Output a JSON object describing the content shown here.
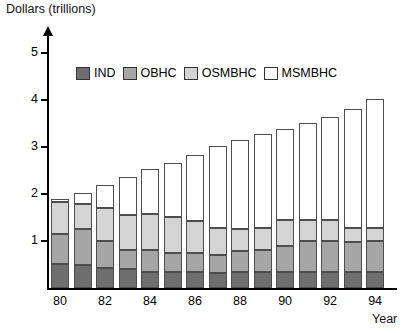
{
  "chart_data": {
    "type": "bar",
    "stacked": true,
    "title": "",
    "xlabel": "Year",
    "ylabel": "Dollars (trillions)",
    "ylim": [
      0,
      5.4
    ],
    "yticks": [
      1,
      2,
      3,
      4,
      5
    ],
    "ytick_labels": [
      "1",
      "2",
      "3",
      "4",
      "5"
    ],
    "grid": false,
    "legend_position": "top-center",
    "categories": [
      "80",
      "81",
      "82",
      "83",
      "84",
      "85",
      "86",
      "87",
      "88",
      "89",
      "90",
      "91",
      "92",
      "93",
      "94"
    ],
    "xtick_labels": [
      "80",
      "",
      "82",
      "",
      "84",
      "",
      "86",
      "",
      "88",
      "",
      "90",
      "",
      "92",
      "",
      "94"
    ],
    "series": [
      {
        "name": "IND",
        "color": "#6e6e6e",
        "values": [
          0.52,
          0.48,
          0.42,
          0.4,
          0.35,
          0.33,
          0.33,
          0.32,
          0.33,
          0.33,
          0.33,
          0.33,
          0.33,
          0.33,
          0.33
        ]
      },
      {
        "name": "OBHC",
        "color": "#a6a6a6",
        "values": [
          0.63,
          0.78,
          0.58,
          0.4,
          0.45,
          0.42,
          0.41,
          0.38,
          0.45,
          0.47,
          0.56,
          0.67,
          0.67,
          0.65,
          0.67
        ]
      },
      {
        "name": "OSMBHC",
        "color": "#d4d4d4",
        "values": [
          0.67,
          0.52,
          0.7,
          0.75,
          0.78,
          0.75,
          0.68,
          0.57,
          0.48,
          0.47,
          0.56,
          0.45,
          0.45,
          0.29,
          0.27
        ]
      },
      {
        "name": "MSMBHC",
        "color": "#ffffff",
        "values": [
          0.07,
          0.24,
          0.5,
          0.8,
          0.95,
          1.16,
          1.4,
          1.75,
          1.88,
          2.0,
          1.94,
          2.06,
          2.18,
          2.53,
          2.75
        ]
      }
    ],
    "totals": [
      1.89,
      2.02,
      2.2,
      2.35,
      2.53,
      2.66,
      2.82,
      3.02,
      3.14,
      3.27,
      3.39,
      3.51,
      3.63,
      3.8,
      4.02
    ]
  },
  "legend": {
    "items": [
      {
        "label": "IND",
        "color": "#6e6e6e"
      },
      {
        "label": "OBHC",
        "color": "#a6a6a6"
      },
      {
        "label": "OSMBHC",
        "color": "#d4d4d4"
      },
      {
        "label": "MSMBHC",
        "color": "#ffffff"
      }
    ]
  },
  "axis": {
    "y_title": "Dollars (trillions)",
    "x_title": "Year"
  }
}
